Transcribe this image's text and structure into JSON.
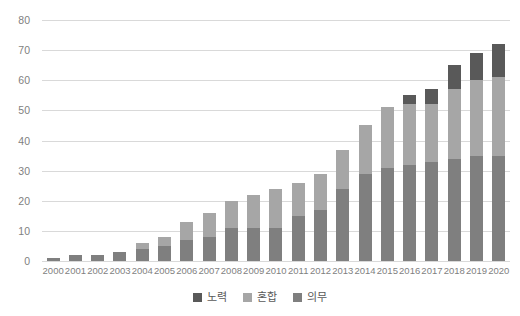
{
  "chart_data": {
    "type": "bar",
    "stacked": true,
    "title": "",
    "subtitle": "",
    "xlabel": "",
    "ylabel": "",
    "ylim": [
      0,
      80
    ],
    "ytick_step": 10,
    "yticks": [
      80,
      70,
      60,
      50,
      40,
      30,
      20,
      10,
      0
    ],
    "grid": true,
    "legend_position": "bottom-center",
    "categories": [
      "2000",
      "2001",
      "2002",
      "2003",
      "2004",
      "2005",
      "2006",
      "2007",
      "2008",
      "2009",
      "2010",
      "2011",
      "2012",
      "2013",
      "2014",
      "2015",
      "2016",
      "2017",
      "2018",
      "2019",
      "2020"
    ],
    "series": [
      {
        "name": "의무",
        "color": "#7f7f7f",
        "values": [
          1,
          2,
          2,
          3,
          4,
          5,
          7,
          8,
          11,
          11,
          11,
          15,
          17,
          24,
          29,
          31,
          32,
          33,
          34,
          35,
          35
        ]
      },
      {
        "name": "혼합",
        "color": "#a6a6a6",
        "values": [
          0,
          0,
          0,
          0,
          2,
          3,
          6,
          8,
          9,
          11,
          13,
          11,
          12,
          13,
          16,
          20,
          20,
          19,
          23,
          25,
          26
        ]
      },
      {
        "name": "노력",
        "color": "#595959",
        "values": [
          0,
          0,
          0,
          0,
          0,
          0,
          0,
          0,
          0,
          0,
          0,
          0,
          0,
          0,
          0,
          0,
          3,
          5,
          8,
          9,
          11
        ]
      }
    ],
    "totals": [
      1,
      2,
      2,
      3,
      6,
      8,
      13,
      16,
      20,
      22,
      24,
      26,
      29,
      37,
      45,
      51,
      55,
      57,
      65,
      69,
      72
    ]
  },
  "legend": {
    "items": [
      {
        "label": "노력",
        "color": "#595959"
      },
      {
        "label": "혼합",
        "color": "#a6a6a6"
      },
      {
        "label": "의무",
        "color": "#7f7f7f"
      }
    ]
  },
  "colors": {
    "gridline": "#d9d9d9",
    "tick_text": "#7f7f7f",
    "legend_text": "#595959",
    "background": "#ffffff"
  }
}
